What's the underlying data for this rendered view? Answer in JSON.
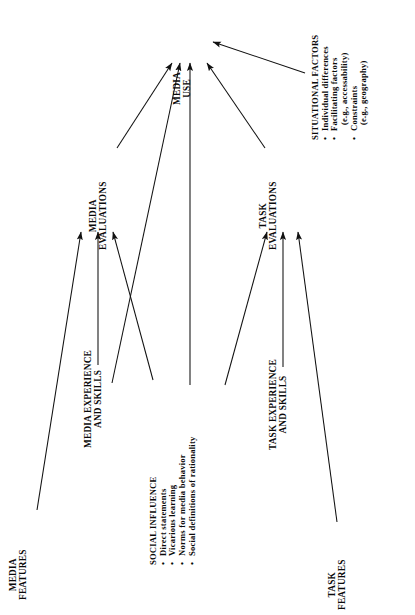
{
  "figure": {
    "type": "concept-model-diagram",
    "orientation": "rotated-90-ccw",
    "background": "#ffffff",
    "ink": "#0a0a0a"
  },
  "nodes": {
    "media_use": {
      "lines": [
        "MEDIA",
        "USE"
      ]
    },
    "media_evaluations": {
      "lines": [
        "MEDIA",
        "EVALUATIONS"
      ]
    },
    "task_evaluations": {
      "lines": [
        "TASK",
        "EVALUATIONS"
      ]
    },
    "media_features": {
      "lines": [
        "MEDIA",
        "FEATURES"
      ]
    },
    "task_features": {
      "lines": [
        "TASK",
        "FEATURES"
      ]
    },
    "media_experience": {
      "lines": [
        "MEDIA EXPERIENCE",
        "AND SKILLS"
      ]
    },
    "task_experience": {
      "lines": [
        "TASK EXPERIENCE",
        "AND SKILLS"
      ]
    },
    "social_influence": {
      "header": "SOCIAL INFLUENCE",
      "bullets": [
        {
          "text": "Direct statements",
          "sub": ""
        },
        {
          "text": "Vicarious learning",
          "sub": ""
        },
        {
          "text": "Norms for media behavior",
          "sub": ""
        },
        {
          "text": "Social definitions of rationality",
          "sub": ""
        }
      ]
    },
    "situational_factors": {
      "header": "SITUATIONAL FACTORS",
      "bullets": [
        {
          "text": "Individual differences",
          "sub": ""
        },
        {
          "text": "Facilitating factors",
          "sub": "(e.g., accessability)"
        },
        {
          "text": "Constraints",
          "sub": "(e.g., geography)"
        }
      ]
    }
  },
  "edges": [
    {
      "from": "media_features",
      "to": "media_evaluations"
    },
    {
      "from": "media_experience",
      "to": "media_evaluations"
    },
    {
      "from": "social_influence",
      "to": "media_evaluations"
    },
    {
      "from": "media_experience",
      "to": "media_use"
    },
    {
      "from": "social_influence",
      "to": "media_use"
    },
    {
      "from": "media_evaluations",
      "to": "media_use"
    },
    {
      "from": "task_evaluations",
      "to": "media_use"
    },
    {
      "from": "situational_factors",
      "to": "media_use"
    },
    {
      "from": "social_influence",
      "to": "task_evaluations"
    },
    {
      "from": "task_experience",
      "to": "task_evaluations"
    },
    {
      "from": "task_features",
      "to": "task_evaluations"
    }
  ]
}
